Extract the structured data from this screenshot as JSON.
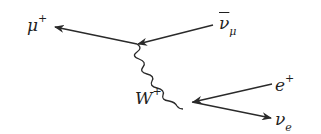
{
  "diagram": {
    "type": "feynman",
    "colors": {
      "line": "#2a2a2a",
      "text": "#1f1f1f",
      "background": "#ffffff"
    },
    "labels": {
      "mu_plus": {
        "base": "μ",
        "sup": "+"
      },
      "anti_nu_mu": {
        "base": "ν",
        "sub": "μ"
      },
      "w_plus": {
        "base": "W",
        "sup": "+"
      },
      "e_plus": {
        "base": "e",
        "sup": "+"
      },
      "nu_e": {
        "base": "ν",
        "sub": "e"
      }
    },
    "vertices": [
      {
        "name": "upper-vertex",
        "x": 137,
        "y": 44
      },
      {
        "name": "lower-vertex",
        "x": 192,
        "y": 102
      }
    ],
    "lines": [
      {
        "name": "mu-plus-line",
        "from": [
          137,
          44
        ],
        "to": [
          54,
          27
        ],
        "style": "solid",
        "arrow": "end"
      },
      {
        "name": "anti-nu-mu-line",
        "from": [
          213,
          25
        ],
        "to": [
          137,
          44
        ],
        "style": "solid",
        "arrow": "end"
      },
      {
        "name": "w-boson-line",
        "from": [
          137,
          44
        ],
        "to": [
          192,
          102
        ],
        "style": "wavy",
        "arrow": "none"
      },
      {
        "name": "e-plus-line",
        "from": [
          272,
          84
        ],
        "to": [
          192,
          102
        ],
        "style": "solid",
        "arrow": "end"
      },
      {
        "name": "nu-e-line",
        "from": [
          192,
          102
        ],
        "to": [
          271,
          118
        ],
        "style": "solid",
        "arrow": "end"
      }
    ]
  }
}
